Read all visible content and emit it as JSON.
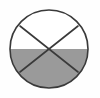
{
  "figure": {
    "name": "sectored-circle-half-shaded",
    "canvas": {
      "width": 100,
      "height": 98,
      "background": "#fefefe"
    },
    "colors": {
      "background": "#fefefe",
      "outline": "#3a3a3a",
      "shaded_fill": "#9a9a9a",
      "unshaded_fill": "#ffffff",
      "divider_line": "#3a3a3a"
    },
    "circle": {
      "center_x": 49,
      "center_y": 49,
      "radius": 39,
      "stroke_width": 1.6
    },
    "horizontal_divider": {
      "label": "horizontal diameter",
      "y": 49,
      "x_start": 10,
      "x_end": 88,
      "drawn": false
    },
    "diagonals": [
      {
        "label": "diagonal-nw-se",
        "x1": 20,
        "y1": 26,
        "x2": 78,
        "y2": 72,
        "stroke_width": 1.6
      },
      {
        "label": "diagonal-ne-sw",
        "x1": 78,
        "y1": 26,
        "x2": 20,
        "y2": 72,
        "stroke_width": 1.6
      }
    ],
    "regions": [
      {
        "label": "top-left sector",
        "shaded": false,
        "fill": "#ffffff"
      },
      {
        "label": "top sector",
        "shaded": false,
        "fill": "#ffffff"
      },
      {
        "label": "top-right sector",
        "shaded": false,
        "fill": "#ffffff"
      },
      {
        "label": "bottom-left sector",
        "shaded": true,
        "fill": "#9a9a9a"
      },
      {
        "label": "bottom sector",
        "shaded": true,
        "fill": "#9a9a9a"
      },
      {
        "label": "bottom-right sector",
        "shaded": true,
        "fill": "#9a9a9a"
      }
    ],
    "shaded_fraction_text": "1/2"
  }
}
